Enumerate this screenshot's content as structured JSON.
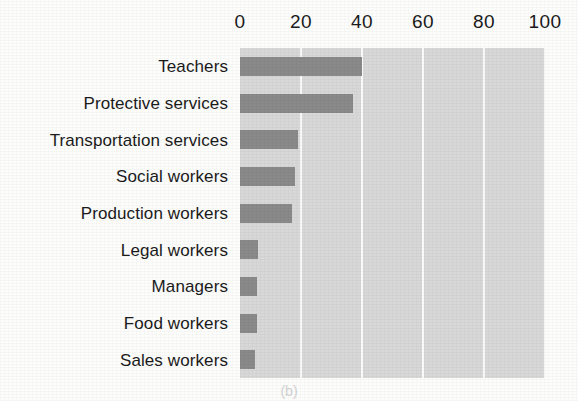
{
  "caption": "(b)",
  "colors": {
    "bar": "#8a8a8a",
    "plot_background": "#d8d8d8",
    "gridline": "#fbfbfb",
    "page_background": "#fdfdfc",
    "text": "#1b1b1b"
  },
  "chart_data": {
    "type": "bar",
    "orientation": "horizontal",
    "title": "",
    "subtitle": "",
    "xlabel": "",
    "ylabel": "",
    "xlim": [
      0,
      100
    ],
    "grid": true,
    "legend": null,
    "axis_position": "top",
    "xticks": [
      0,
      20,
      40,
      60,
      80,
      100
    ],
    "xtick_labels": [
      "0",
      "20",
      "40",
      "60",
      "80",
      "100"
    ],
    "categories": [
      "Teachers",
      "Protective services",
      "Transportation services",
      "Social workers",
      "Production workers",
      "Legal workers",
      "Managers",
      "Food workers",
      "Sales workers"
    ],
    "values": [
      40,
      37,
      19,
      18,
      17,
      6,
      5.5,
      5.5,
      5
    ]
  }
}
